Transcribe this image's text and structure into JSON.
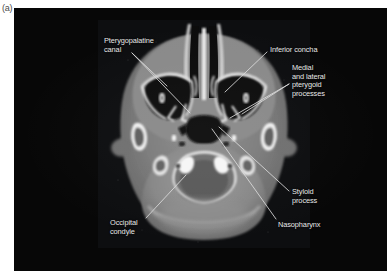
{
  "figure": {
    "panel_label": "(a)",
    "modality": "axial CT",
    "region": "skull base / nasopharynx",
    "background_color": "#070707",
    "label_color": "#e8e8e8",
    "leader_color": "#dcdcdc"
  },
  "annotations": [
    {
      "id": "pterygopalatine-canal",
      "lines": [
        "Pterygopalatine",
        "canal"
      ],
      "text_x": 90,
      "text_y": 29,
      "leaders": [
        {
          "x1": 118,
          "y1": 45,
          "x2": 153,
          "y2": 78
        },
        {
          "x1": 118,
          "y1": 45,
          "x2": 176,
          "y2": 105
        }
      ]
    },
    {
      "id": "inferior-concha",
      "lines": [
        "Inferior concha"
      ],
      "text_x": 256,
      "text_y": 38,
      "leaders": [
        {
          "x1": 253,
          "y1": 44,
          "x2": 211,
          "y2": 84
        }
      ]
    },
    {
      "id": "medial-and-lateral-pterygoid-processes",
      "lines": [
        "Medial",
        "and lateral",
        "pterygoid",
        "processes"
      ],
      "text_x": 278,
      "text_y": 56,
      "leaders": [
        {
          "x1": 275,
          "y1": 76,
          "x2": 216,
          "y2": 110
        },
        {
          "x1": 275,
          "y1": 76,
          "x2": 228,
          "y2": 106
        }
      ]
    },
    {
      "id": "styloid-process",
      "lines": [
        "Styloid",
        "process"
      ],
      "text_x": 278,
      "text_y": 180,
      "leaders": [
        {
          "x1": 275,
          "y1": 183,
          "x2": 205,
          "y2": 119
        }
      ]
    },
    {
      "id": "nasopharynx",
      "lines": [
        "Nasopharynx"
      ],
      "text_x": 264,
      "text_y": 213,
      "leaders": [
        {
          "x1": 262,
          "y1": 211,
          "x2": 198,
          "y2": 121
        }
      ]
    },
    {
      "id": "occipital-condyle",
      "lines": [
        "Occipital",
        "condyle"
      ],
      "text_x": 96,
      "text_y": 211,
      "leaders": [
        {
          "x1": 132,
          "y1": 210,
          "x2": 172,
          "y2": 167
        }
      ]
    }
  ]
}
